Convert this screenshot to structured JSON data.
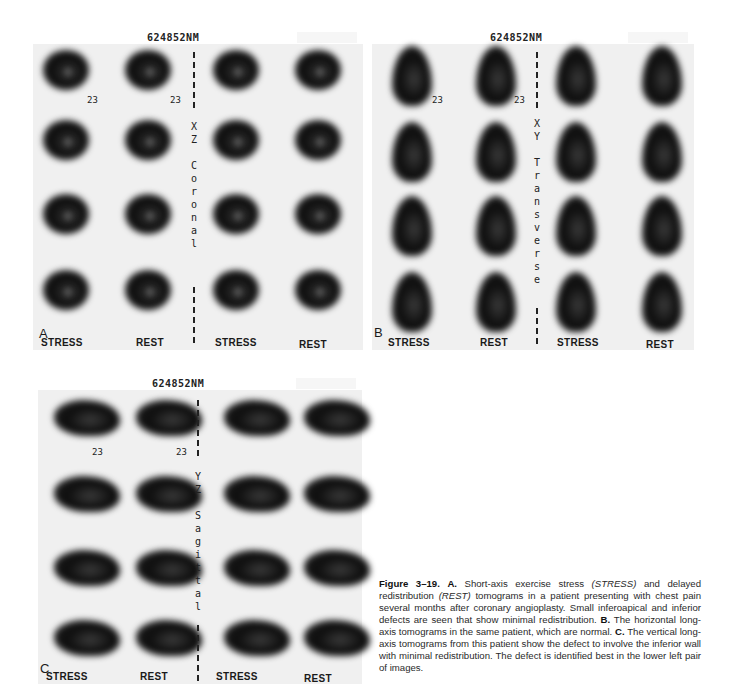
{
  "figure": {
    "patient_id": "624852NM",
    "slice_number": "23",
    "column_labels": [
      "STRESS",
      "REST",
      "STRESS",
      "REST"
    ],
    "panels": [
      {
        "letter": "A",
        "axis_label": "X\nZ\n\nC\no\nr\no\nn\na\nl",
        "view": "coronal"
      },
      {
        "letter": "B",
        "axis_label": "X\nY\n\nT\nr\na\nn\ns\nv\ne\nr\ns\ne",
        "view": "transverse"
      },
      {
        "letter": "C",
        "axis_label": "Y\nZ\n\nS\na\ng\ni\nt\nt\na\nl",
        "view": "sagittal"
      }
    ]
  },
  "caption": {
    "figure_label": "Figure 3–19.",
    "a_label": "A.",
    "a_text_1": "Short-axis exercise stress",
    "a_stress": "(STRESS)",
    "a_text_2": "and delayed redistribution",
    "a_rest": "(REST)",
    "a_text_3": "tomograms in a patient presenting with chest pain several months after coronary angioplasty. Small inferoapical and inferior defects are seen that show minimal redistribution.",
    "b_label": "B.",
    "b_text": "The horizontal long-axis tomograms in the same patient, which are normal.",
    "c_label": "C.",
    "c_text": "The vertical long-axis tomograms from this patient show the defect to involve the inferior wall with minimal redistribution. The defect is identified best in the lower left pair of images."
  }
}
